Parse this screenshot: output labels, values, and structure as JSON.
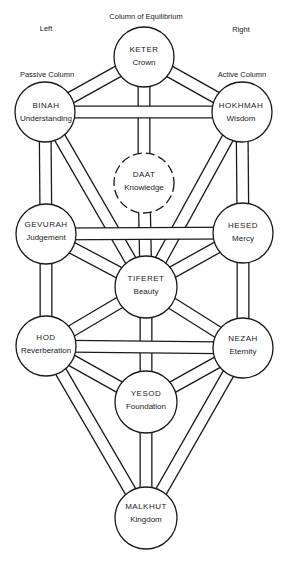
{
  "header": {
    "center_title": "Column of Equilibrium",
    "left_label": "Left",
    "right_label": "Right",
    "left_column": "Passive Column",
    "right_column": "Active Column"
  },
  "nodes": [
    {
      "id": "keter",
      "name": "KETER",
      "meaning": "Crown",
      "x": 144,
      "y": 57,
      "r": 30,
      "dashed": false
    },
    {
      "id": "binah",
      "name": "BINAH",
      "meaning": "Understanding",
      "x": 45,
      "y": 112,
      "r": 30,
      "dashed": false
    },
    {
      "id": "hokhmah",
      "name": "HOKHMAH",
      "meaning": "Wisdom",
      "x": 242,
      "y": 112,
      "r": 30,
      "dashed": false
    },
    {
      "id": "daat",
      "name": "DAAT",
      "meaning": "Knowledge",
      "x": 144,
      "y": 183,
      "r": 30,
      "dashed": true
    },
    {
      "id": "gevurah",
      "name": "GEVURAH",
      "meaning": "Judgement",
      "x": 46,
      "y": 234,
      "r": 30,
      "dashed": false
    },
    {
      "id": "hesed",
      "name": "HESED",
      "meaning": "Mercy",
      "x": 243,
      "y": 233,
      "r": 30,
      "dashed": false
    },
    {
      "id": "tiferet",
      "name": "TIFERET",
      "meaning": "Beauty",
      "x": 146,
      "y": 287,
      "r": 31,
      "dashed": false
    },
    {
      "id": "hod",
      "name": "HOD",
      "meaning": "Reverberation",
      "x": 46,
      "y": 346,
      "r": 30,
      "dashed": false
    },
    {
      "id": "nezah",
      "name": "NEZAH",
      "meaning": "Eternity",
      "x": 243,
      "y": 348,
      "r": 30,
      "dashed": false
    },
    {
      "id": "yesod",
      "name": "YESOD",
      "meaning": "Foundation",
      "x": 146,
      "y": 402,
      "r": 31,
      "dashed": false
    },
    {
      "id": "malkhut",
      "name": "MALKHUT",
      "meaning": "Kingdom",
      "x": 146,
      "y": 518,
      "r": 31,
      "dashed": false
    }
  ],
  "paths": [
    [
      "binah",
      "tiferet"
    ],
    [
      "hokhmah",
      "tiferet"
    ],
    [
      "gevurah",
      "tiferet"
    ],
    [
      "hesed",
      "tiferet"
    ],
    [
      "tiferet",
      "hod"
    ],
    [
      "tiferet",
      "nezah"
    ],
    [
      "hod",
      "yesod"
    ],
    [
      "nezah",
      "yesod"
    ],
    [
      "hod",
      "malkhut"
    ],
    [
      "nezah",
      "malkhut"
    ],
    [
      "yesod",
      "malkhut"
    ],
    [
      "keter",
      "binah"
    ],
    [
      "keter",
      "hokhmah"
    ],
    [
      "binah",
      "gevurah"
    ],
    [
      "hokhmah",
      "hesed"
    ],
    [
      "gevurah",
      "hod"
    ],
    [
      "hesed",
      "nezah"
    ],
    [
      "keter",
      "daat"
    ],
    [
      "daat",
      "tiferet"
    ],
    [
      "tiferet",
      "yesod"
    ],
    [
      "binah",
      "hokhmah"
    ],
    [
      "gevurah",
      "hesed"
    ],
    [
      "hod",
      "nezah"
    ]
  ],
  "style": {
    "line_color": "#1a1a1a",
    "fill_color": "#ffffff",
    "channel_width": 13,
    "stroke_width": 1.3
  }
}
